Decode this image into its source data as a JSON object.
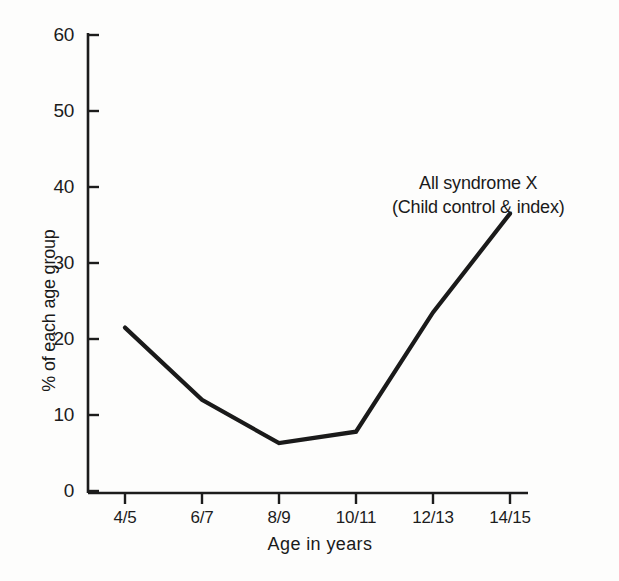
{
  "chart_data": {
    "type": "line",
    "title": "",
    "subtitle": "",
    "xlabel": "Age in years",
    "ylabel": "% of each age group",
    "categories": [
      "4/5",
      "6/7",
      "8/9",
      "10/11",
      "12/13",
      "14/15"
    ],
    "series": [
      {
        "name": "All syndrome X (Child control & index)",
        "values": [
          21.5,
          12.0,
          6.3,
          7.8,
          23.5,
          36.5
        ]
      }
    ],
    "ylim": [
      0,
      60
    ],
    "yticks": [
      "0",
      "10",
      "20",
      "30",
      "40",
      "50",
      "60"
    ],
    "ytick_values": [
      0,
      10,
      20,
      30,
      40,
      50,
      60
    ],
    "grid": false,
    "legend_position": "none",
    "annotations": [
      {
        "line1": "All syndrome X",
        "line2": "(Child control & index)"
      }
    ],
    "line_color": "#1a1a1a",
    "background_color": "#fdfdfc",
    "axis_color": "#1c1c1c"
  },
  "axis": {
    "y_title": "% of each age group",
    "x_title": "Age in years"
  },
  "annotation": {
    "line1": "All syndrome X",
    "line2": "(Child control & index)"
  }
}
